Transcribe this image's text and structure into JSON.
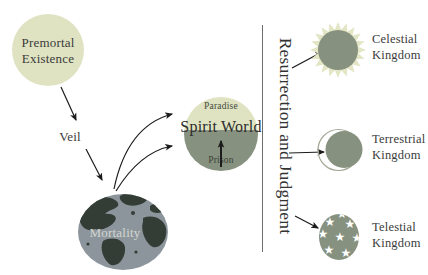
{
  "diagram": {
    "premortal": {
      "line1": "Premortal",
      "line2": "Existence"
    },
    "veil": {
      "label": "Veil"
    },
    "mortality": {
      "label": "Mortality"
    },
    "spirit_world": {
      "label": "Spirit World",
      "paradise": "Paradise",
      "prison": "Prison"
    },
    "resurrection": {
      "label": "Resurrection and Judgment"
    },
    "kingdoms": {
      "celestial": {
        "line1": "Celestial",
        "line2": "Kingdom",
        "icon": "sun-icon"
      },
      "terrestrial": {
        "line1": "Terrestrial",
        "line2": "Kingdom",
        "icon": "moon-icon"
      },
      "telestial": {
        "line1": "Telestial",
        "line2": "Kingdom",
        "icon": "stars-icon",
        "star_glyph": "★"
      }
    },
    "colors": {
      "pale_green": "#dfe3c2",
      "sun_rays": "#e3e6c4",
      "gray_green": "#87917f",
      "globe_ocean": "#8d959c",
      "globe_land": "#333d36",
      "text_dark": "#3a3a3a",
      "mortality_text": "#d2d6cf"
    }
  }
}
